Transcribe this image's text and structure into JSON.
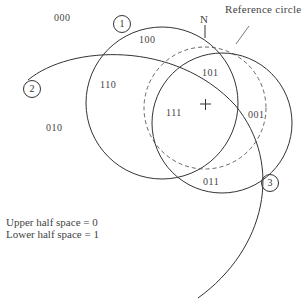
{
  "regions": [
    {
      "code": "000",
      "x": 54,
      "y": 12
    },
    {
      "code": "100",
      "x": 139,
      "y": 34
    },
    {
      "code": "110",
      "x": 100,
      "y": 79
    },
    {
      "code": "010",
      "x": 46,
      "y": 122
    },
    {
      "code": "101",
      "x": 202,
      "y": 67
    },
    {
      "code": "111",
      "x": 166,
      "y": 107
    },
    {
      "code": "001",
      "x": 248,
      "y": 109
    },
    {
      "code": "011",
      "x": 203,
      "y": 176
    }
  ],
  "plane_labels": [
    {
      "id": "1",
      "x": 113,
      "y": 15
    },
    {
      "id": "2",
      "x": 23,
      "y": 81
    },
    {
      "id": "3",
      "x": 261,
      "y": 175
    }
  ],
  "annotations": {
    "north": "N",
    "reference": "Reference circle",
    "center_mark": "+"
  },
  "legend": {
    "line1": "Upper half space = 0",
    "line2": "Lower half space = 1"
  },
  "colors": {
    "stroke": "#333333",
    "background": "#ffffff"
  }
}
